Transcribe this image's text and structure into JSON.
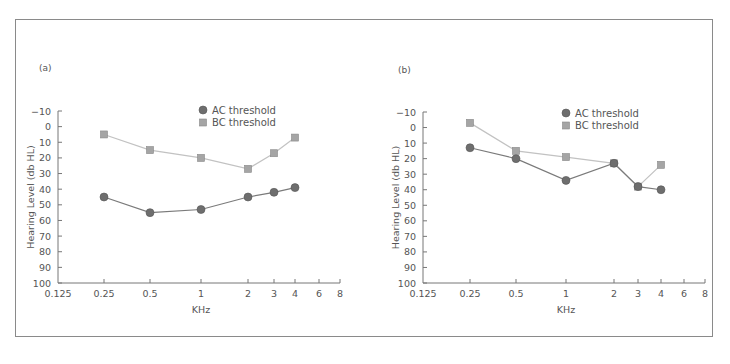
{
  "chart_data": [
    {
      "type": "line",
      "panel_label": "(a)",
      "title": "",
      "xlabel": "KHz",
      "ylabel": "Hearing Level (db HL)",
      "x_scale": "log2",
      "x_ticks": [
        "0.125",
        "0.25",
        "0.5",
        "1",
        "2",
        "3",
        "4",
        "6",
        "8"
      ],
      "y_ticks": [
        "−10",
        "0",
        "10",
        "20",
        "30",
        "40",
        "50",
        "60",
        "70",
        "80",
        "90",
        "100"
      ],
      "ylim": [
        -10,
        100
      ],
      "y_inverted": true,
      "grid": false,
      "legend_position": "upper center",
      "x": [
        0.25,
        0.5,
        1,
        2,
        3,
        4
      ],
      "series": [
        {
          "name": "AC threshold",
          "marker": "circle",
          "values": [
            45,
            55,
            53,
            45,
            42,
            39
          ]
        },
        {
          "name": "BC threshold",
          "marker": "square",
          "values": [
            5,
            15,
            20,
            27,
            17,
            7
          ]
        }
      ]
    },
    {
      "type": "line",
      "panel_label": "(b)",
      "title": "",
      "xlabel": "KHz",
      "ylabel": "Hearing Level (db HL)",
      "x_scale": "log2",
      "x_ticks": [
        "0.125",
        "0.25",
        "0.5",
        "1",
        "2",
        "3",
        "4",
        "6",
        "8"
      ],
      "y_ticks": [
        "−10",
        "0",
        "10",
        "20",
        "30",
        "40",
        "50",
        "60",
        "70",
        "80",
        "90",
        "100"
      ],
      "ylim": [
        -10,
        100
      ],
      "y_inverted": true,
      "grid": false,
      "legend_position": "upper center",
      "x": [
        0.25,
        0.5,
        1,
        2,
        3,
        4
      ],
      "series": [
        {
          "name": "AC threshold",
          "marker": "circle",
          "values": [
            13,
            20,
            34,
            23,
            38,
            40
          ]
        },
        {
          "name": "BC threshold",
          "marker": "square",
          "values": [
            -3,
            15,
            19,
            23,
            38,
            24
          ]
        }
      ]
    }
  ],
  "colors": {
    "ac_marker": "#6e6e6e",
    "ac_line": "#7a7a7a",
    "bc_marker": "#a5a5a5",
    "bc_line": "#c2c2c2",
    "axis": "#777777",
    "frame": "#8a8a8a"
  }
}
